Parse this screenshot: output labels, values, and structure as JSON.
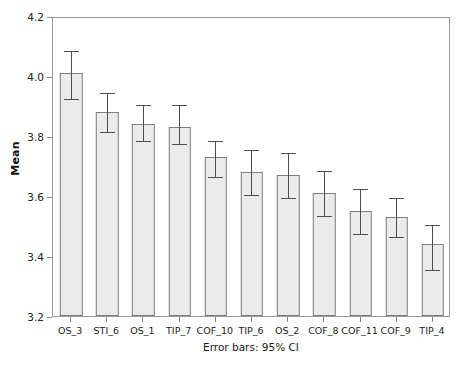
{
  "chart_data": {
    "type": "bar",
    "title": "",
    "subtitle": "",
    "xlabel": "",
    "ylabel": "Mean",
    "footnote": "Error bars: 95% CI",
    "ylim": [
      3.2,
      4.2
    ],
    "yticks": [
      "3.2",
      "3.4",
      "3.6",
      "3.8",
      "4.0",
      "4.2"
    ],
    "ytick_values": [
      3.2,
      3.4,
      3.6,
      3.8,
      4.0,
      4.2
    ],
    "grid": false,
    "legend": "none",
    "error_bar_type": "95% CI",
    "categories": [
      "OS_3",
      "STI_6",
      "OS_1",
      "TIP_7",
      "COF_10",
      "TIP_6",
      "OS_2",
      "COF_8",
      "COF_11",
      "COF_9",
      "TIP_4"
    ],
    "values": [
      4.01,
      3.88,
      3.84,
      3.83,
      3.73,
      3.68,
      3.67,
      3.61,
      3.55,
      3.53,
      3.44
    ],
    "ci_lower": [
      3.93,
      3.82,
      3.79,
      3.78,
      3.67,
      3.61,
      3.6,
      3.54,
      3.48,
      3.47,
      3.36
    ],
    "ci_upper": [
      4.09,
      3.95,
      3.91,
      3.91,
      3.79,
      3.76,
      3.75,
      3.69,
      3.63,
      3.6,
      3.51
    ],
    "bar_fill_color": "#ebebeb",
    "bar_border_color": "#7d7d7d",
    "error_bar_color": "#4d4d4d",
    "frame_color": "#9a9a9a"
  }
}
